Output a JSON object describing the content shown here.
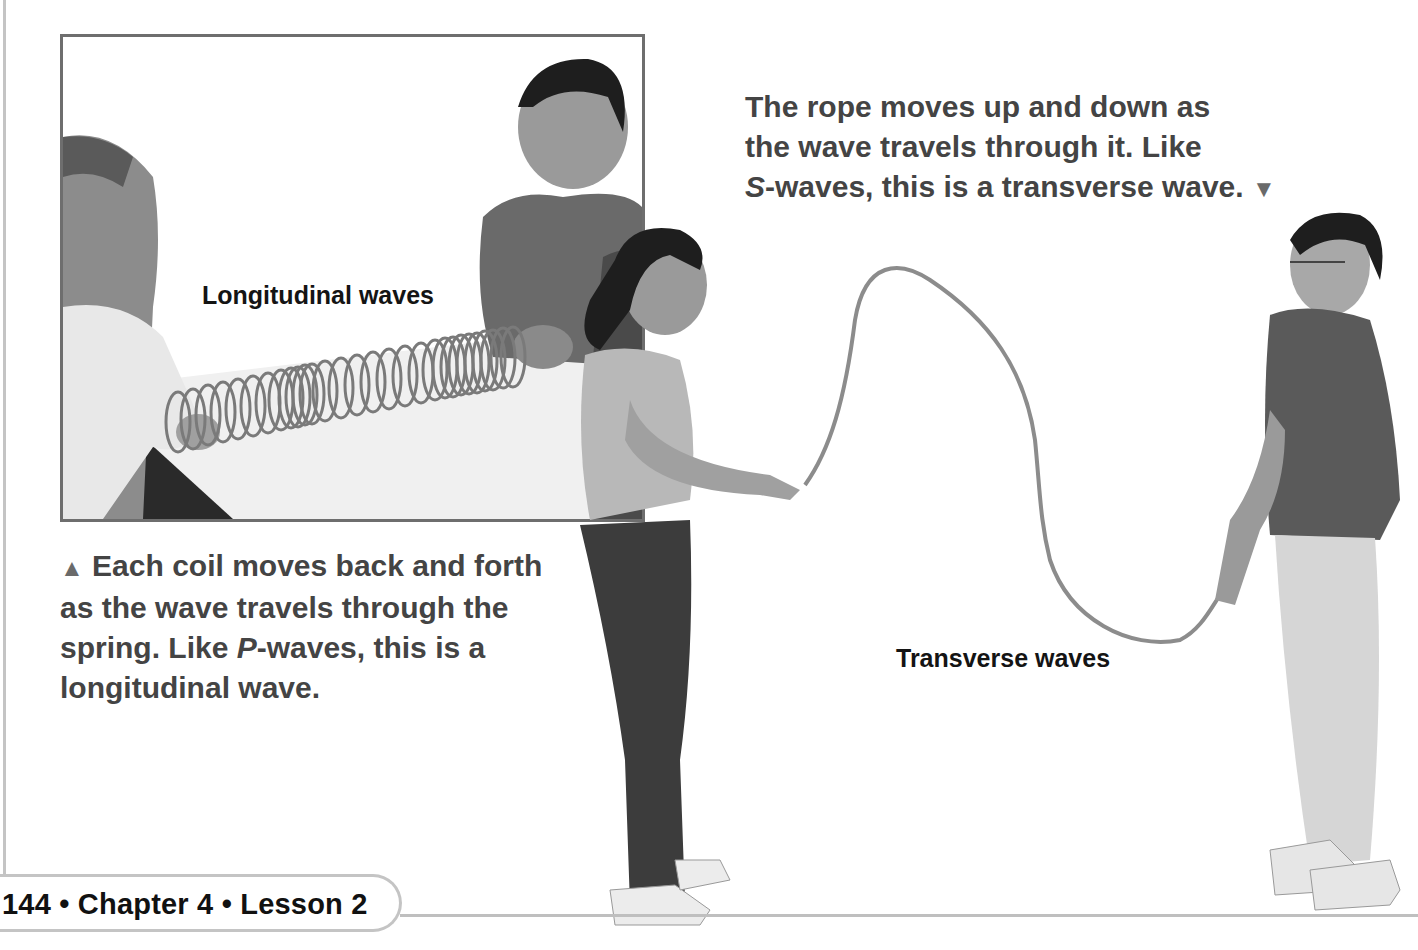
{
  "page": {
    "footer": {
      "page_number": "144",
      "separator": "•",
      "chapter": "Chapter 4",
      "lesson": "Lesson 2",
      "full_text": "144 • Chapter 4 • Lesson 2"
    }
  },
  "figures": {
    "longitudinal": {
      "label": "Longitudinal waves",
      "image_description": "Two students stretch a coiled spring (slinky) across a table",
      "caption": {
        "marker": "▲",
        "line1": "Each coil moves back and forth",
        "line2": "as the wave travels through the",
        "line3_pre": "spring. Like ",
        "line3_italic": "P",
        "line3_post": "-waves, this is a",
        "line4": "longitudinal wave."
      }
    },
    "transverse": {
      "label": "Transverse waves",
      "image_description": "Two students hold a rope forming a wave between them",
      "caption": {
        "line1": "The rope moves up and down as",
        "line2": "the wave travels through it. Like",
        "line3_italic": "S",
        "line3_post": "-waves, this is a transverse wave.",
        "marker": "▼"
      }
    }
  },
  "colors": {
    "caption_text": "#444444",
    "label_text": "#141414",
    "frame_border": "#6e6e6e",
    "rule": "#c4c4c4"
  }
}
